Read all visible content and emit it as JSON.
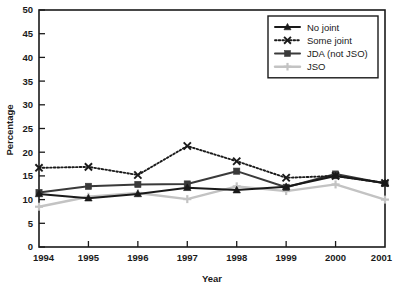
{
  "chart_data": {
    "type": "line",
    "title": "",
    "subtitle": "",
    "xlabel": "Year",
    "ylabel": "Percentage",
    "categories": [
      "1994",
      "1995",
      "1996",
      "1997",
      "1998",
      "1999",
      "2000",
      "2001"
    ],
    "x": [
      1994,
      1995,
      1996,
      1997,
      1998,
      1999,
      2000,
      2001
    ],
    "xlim": [
      1994,
      2001
    ],
    "ylim": [
      0,
      50
    ],
    "ytick_labels": [
      "0",
      "5",
      "10",
      "15",
      "20",
      "25",
      "30",
      "35",
      "40",
      "45",
      "50"
    ],
    "yticks": [
      0,
      5,
      10,
      15,
      20,
      25,
      30,
      35,
      40,
      45,
      50
    ],
    "xtick_labels": [
      "1994",
      "1995",
      "1996",
      "1997",
      "1998",
      "1999",
      "2000",
      "2001"
    ],
    "grid": false,
    "legend_position": "top-right",
    "series": [
      {
        "name": "No joint",
        "marker": "triangle",
        "linestyle": "solid",
        "color": "#1a1a1a",
        "values": [
          11.2,
          10.3,
          11.2,
          12.5,
          12.0,
          12.7,
          15.0,
          13.5
        ]
      },
      {
        "name": "Some joint",
        "marker": "x",
        "linestyle": "dotted",
        "color": "#1a1a1a",
        "values": [
          16.7,
          16.9,
          15.2,
          21.3,
          18.1,
          14.6,
          15.0,
          13.5
        ]
      },
      {
        "name": "JDA (not JSO)",
        "marker": "square",
        "linestyle": "solid",
        "color": "#3a3a3a",
        "values": [
          11.5,
          12.8,
          13.2,
          13.3,
          16.0,
          12.6,
          15.4,
          13.4
        ]
      },
      {
        "name": "JSO",
        "marker": "plus",
        "linestyle": "solid",
        "color": "#c3c3c3",
        "values": [
          8.5,
          10.6,
          11.4,
          10.1,
          12.8,
          11.8,
          13.2,
          10.0
        ]
      }
    ]
  },
  "legend": {
    "entries": [
      {
        "label": "No joint"
      },
      {
        "label": "Some joint"
      },
      {
        "label": "JDA (not JSO)"
      },
      {
        "label": "JSO"
      }
    ]
  },
  "axes": {
    "y_title": "Percentage",
    "x_title": "Year",
    "y_labels": [
      "50",
      "45",
      "40",
      "35",
      "30",
      "25",
      "20",
      "15",
      "10",
      "5",
      "0"
    ],
    "x_labels": [
      "1994",
      "1995",
      "1996",
      "1997",
      "1998",
      "1999",
      "2000",
      "2001"
    ]
  },
  "colors": {
    "axis": "#1a1a1a",
    "no_joint": "#1a1a1a",
    "some_joint": "#1a1a1a",
    "jda": "#3a3a3a",
    "jso": "#c3c3c3",
    "background": "#ffffff"
  }
}
